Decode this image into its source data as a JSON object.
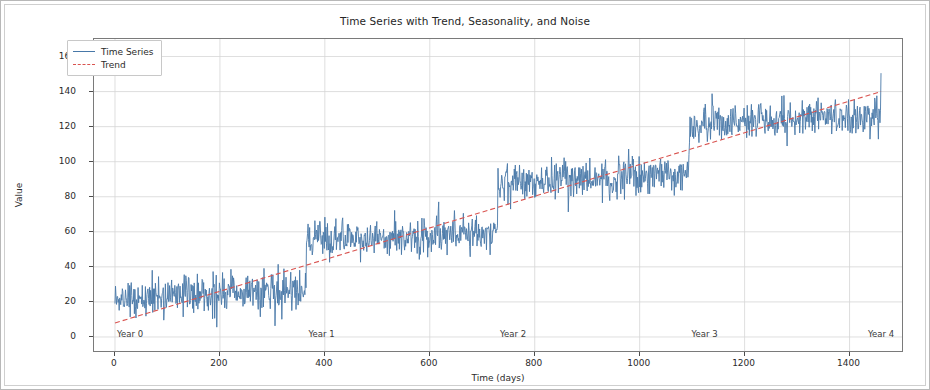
{
  "chart_data": {
    "type": "line",
    "title": "Time Series with Trend, Seasonality, and Noise",
    "xlabel": "Time (days)",
    "ylabel": "Value",
    "xlim": [
      -40,
      1500
    ],
    "ylim": [
      -8,
      170
    ],
    "xticks": [
      0,
      200,
      400,
      600,
      800,
      1000,
      1200,
      1400
    ],
    "yticks": [
      0,
      20,
      40,
      60,
      80,
      100,
      120,
      140,
      160
    ],
    "grid": true,
    "legend_position": "upper left",
    "annotations": [
      {
        "label": "Year 0",
        "x": 0
      },
      {
        "label": "Year 1",
        "x": 365
      },
      {
        "label": "Year 2",
        "x": 730
      },
      {
        "label": "Year 3",
        "x": 1095
      },
      {
        "label": "Year 4",
        "x": 1460
      }
    ],
    "colors": {
      "time_series": "#4878a8",
      "trend": "#d9534f",
      "grid": "#d6d6d6",
      "axis": "#7a7a7a"
    },
    "series": [
      {
        "name": "Time Series",
        "style": "solid",
        "color": "#4878a8",
        "description": "Daily observations combining a linear upward trend, a sawtooth annual seasonality that jumps up at each year boundary and decays through the year, plus Gaussian noise.",
        "model": {
          "trend_intercept": 8,
          "trend_slope_per_day": 0.0904,
          "season_amplitude": 14,
          "season_period_days": 365,
          "noise_std": 5.5
        },
        "n_points": 1461,
        "x_start": 0,
        "x_end": 1460,
        "y_min_observed": 3,
        "y_max_observed": 161
      },
      {
        "name": "Trend",
        "style": "dashed",
        "color": "#d9534f",
        "x": [
          0,
          1460
        ],
        "values": [
          8,
          140
        ]
      }
    ]
  },
  "legend": {
    "items": [
      {
        "label": "Time Series"
      },
      {
        "label": "Trend"
      }
    ]
  }
}
